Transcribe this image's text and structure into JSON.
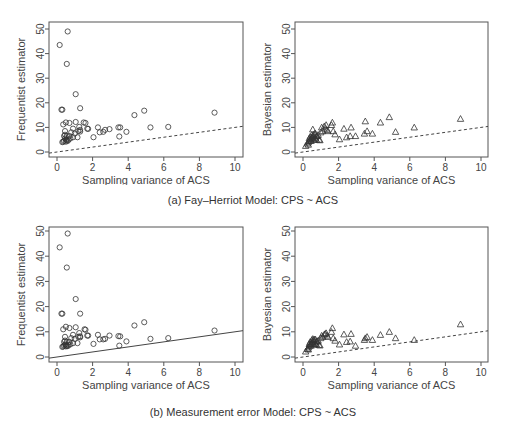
{
  "figure": {
    "caption_a": "(a) Fay–Herriot Model: CPS ~ ACS",
    "caption_b": "(b) Measurement error Model: CPS ~ ACS"
  },
  "chart_data": [
    {
      "id": "a-left",
      "type": "scatter",
      "title": "",
      "xlabel": "Sampling variance of ACS",
      "ylabel": "Frequentist estimator",
      "xlim": [
        0,
        10
      ],
      "ylim": [
        0,
        50
      ],
      "xticks": [
        0,
        2,
        4,
        6,
        8,
        10
      ],
      "yticks": [
        0,
        10,
        20,
        30,
        40,
        50
      ],
      "marker": "circle",
      "reference_line": {
        "style": "dashed",
        "slope": 1,
        "intercept": 0
      },
      "grid": false,
      "points": [
        [
          0.15,
          43.5
        ],
        [
          0.6,
          49
        ],
        [
          0.55,
          35.8
        ],
        [
          1.05,
          23.5
        ],
        [
          0.25,
          17.2
        ],
        [
          0.3,
          17.2
        ],
        [
          1.3,
          17.8
        ],
        [
          0.35,
          11.2
        ],
        [
          0.5,
          12
        ],
        [
          0.7,
          11.8
        ],
        [
          1.05,
          12.2
        ],
        [
          1.5,
          12
        ],
        [
          1.6,
          11.8
        ],
        [
          1.25,
          10.2
        ],
        [
          1.7,
          9.5
        ],
        [
          1.75,
          9.4
        ],
        [
          0.45,
          8.5
        ],
        [
          0.9,
          9.5
        ],
        [
          1.3,
          9.0
        ],
        [
          2.3,
          10
        ],
        [
          2.6,
          8.2
        ],
        [
          2.7,
          9
        ],
        [
          2.95,
          9.3
        ],
        [
          3.45,
          10
        ],
        [
          3.55,
          10
        ],
        [
          3.5,
          6.3
        ],
        [
          3.9,
          8.2
        ],
        [
          4.35,
          15
        ],
        [
          4.9,
          16.8
        ],
        [
          5.25,
          10
        ],
        [
          6.25,
          10.2
        ],
        [
          8.85,
          16
        ],
        [
          2.05,
          6
        ],
        [
          2.4,
          8
        ],
        [
          0.8,
          8
        ],
        [
          1.0,
          7.5
        ],
        [
          1.15,
          6
        ],
        [
          0.4,
          6.5
        ],
        [
          0.45,
          5.5
        ],
        [
          0.5,
          5
        ],
        [
          0.55,
          4.8
        ],
        [
          0.6,
          4.5
        ],
        [
          0.3,
          4
        ],
        [
          0.35,
          4.2
        ],
        [
          0.4,
          4.5
        ],
        [
          0.5,
          4.2
        ],
        [
          0.65,
          5
        ],
        [
          0.75,
          5.5
        ],
        [
          0.9,
          6
        ],
        [
          0.45,
          7
        ],
        [
          0.55,
          6.5
        ],
        [
          1.2,
          8.5
        ],
        [
          1.3,
          8.3
        ],
        [
          0.7,
          6.5
        ]
      ]
    },
    {
      "id": "a-right",
      "type": "scatter",
      "title": "",
      "xlabel": "Sampling variance of ACS",
      "ylabel": "Bayesian estimator",
      "xlim": [
        0,
        10
      ],
      "ylim": [
        0,
        50
      ],
      "xticks": [
        0,
        2,
        4,
        6,
        8,
        10
      ],
      "yticks": [
        0,
        10,
        20,
        30,
        40,
        50
      ],
      "marker": "triangle",
      "reference_line": {
        "style": "dashed",
        "slope": 1,
        "intercept": 0
      },
      "grid": false,
      "points": [
        [
          0.15,
          2.5
        ],
        [
          0.25,
          3.5
        ],
        [
          0.3,
          4
        ],
        [
          0.35,
          4.5
        ],
        [
          0.4,
          5
        ],
        [
          0.45,
          5.5
        ],
        [
          0.5,
          6
        ],
        [
          0.55,
          6.5
        ],
        [
          0.6,
          7
        ],
        [
          0.65,
          6
        ],
        [
          0.7,
          5.5
        ],
        [
          0.75,
          5
        ],
        [
          0.8,
          6.5
        ],
        [
          0.85,
          7
        ],
        [
          0.9,
          5
        ],
        [
          0.95,
          4.8
        ],
        [
          0.55,
          9.2
        ],
        [
          0.4,
          6.2
        ],
        [
          0.5,
          7
        ],
        [
          0.6,
          5
        ],
        [
          0.7,
          7.5
        ],
        [
          1.0,
          8
        ],
        [
          1.05,
          10
        ],
        [
          1.1,
          8.5
        ],
        [
          1.2,
          10.5
        ],
        [
          1.25,
          9.5
        ],
        [
          1.3,
          11
        ],
        [
          1.35,
          9
        ],
        [
          1.4,
          8.5
        ],
        [
          1.6,
          11
        ],
        [
          1.65,
          12
        ],
        [
          1.7,
          8.5
        ],
        [
          1.8,
          7.2
        ],
        [
          2.05,
          5.2
        ],
        [
          2.3,
          9.5
        ],
        [
          2.45,
          6
        ],
        [
          2.65,
          6.5
        ],
        [
          2.7,
          10
        ],
        [
          2.95,
          6.5
        ],
        [
          3.45,
          7.5
        ],
        [
          3.5,
          12.5
        ],
        [
          3.6,
          8.5
        ],
        [
          3.9,
          7.5
        ],
        [
          4.35,
          12
        ],
        [
          4.85,
          14.2
        ],
        [
          5.2,
          8.2
        ],
        [
          6.25,
          10
        ],
        [
          8.85,
          13.5
        ],
        [
          0.3,
          3
        ],
        [
          0.45,
          4.5
        ],
        [
          0.55,
          5.5
        ],
        [
          0.65,
          7.5
        ],
        [
          0.75,
          6.5
        ],
        [
          0.35,
          5.5
        ]
      ]
    },
    {
      "id": "b-left",
      "type": "scatter",
      "title": "",
      "xlabel": "Sampling variance of ACS",
      "ylabel": "Frequentist estimator",
      "xlim": [
        0,
        10
      ],
      "ylim": [
        0,
        50
      ],
      "xticks": [
        0,
        2,
        4,
        6,
        8,
        10
      ],
      "yticks": [
        0,
        10,
        20,
        30,
        40,
        50
      ],
      "marker": "circle",
      "reference_line": {
        "style": "solid",
        "slope": 1,
        "intercept": 0
      },
      "grid": false,
      "points": [
        [
          0.15,
          43.5
        ],
        [
          0.6,
          49
        ],
        [
          0.55,
          35.5
        ],
        [
          1.05,
          23
        ],
        [
          0.25,
          17.2
        ],
        [
          0.3,
          17.2
        ],
        [
          1.3,
          17.2
        ],
        [
          0.35,
          11
        ],
        [
          0.5,
          12
        ],
        [
          0.7,
          11.5
        ],
        [
          1.05,
          11.8
        ],
        [
          1.55,
          11
        ],
        [
          1.6,
          10.8
        ],
        [
          1.25,
          9.5
        ],
        [
          1.7,
          8.5
        ],
        [
          1.75,
          8.5
        ],
        [
          0.45,
          8
        ],
        [
          0.9,
          8.8
        ],
        [
          1.3,
          8.2
        ],
        [
          2.3,
          8.8
        ],
        [
          2.6,
          7
        ],
        [
          2.7,
          7.2
        ],
        [
          2.95,
          8.5
        ],
        [
          3.45,
          8.3
        ],
        [
          3.55,
          8.2
        ],
        [
          3.5,
          4.5
        ],
        [
          3.9,
          6.2
        ],
        [
          4.35,
          12.5
        ],
        [
          4.9,
          13.8
        ],
        [
          5.25,
          7.2
        ],
        [
          6.25,
          7.5
        ],
        [
          8.85,
          10.5
        ],
        [
          2.05,
          5.2
        ],
        [
          2.4,
          7
        ],
        [
          0.8,
          7.5
        ],
        [
          1.0,
          7.2
        ],
        [
          1.15,
          5.5
        ],
        [
          0.4,
          6
        ],
        [
          0.45,
          5
        ],
        [
          0.5,
          4.8
        ],
        [
          0.55,
          4.5
        ],
        [
          0.6,
          4.3
        ],
        [
          0.3,
          4
        ],
        [
          0.35,
          4.2
        ],
        [
          0.4,
          4.5
        ],
        [
          0.5,
          4.2
        ],
        [
          0.65,
          4.8
        ],
        [
          0.75,
          5
        ],
        [
          0.9,
          5.5
        ],
        [
          0.45,
          6.5
        ],
        [
          0.55,
          6
        ],
        [
          1.2,
          8
        ],
        [
          1.3,
          7.8
        ],
        [
          0.7,
          6
        ]
      ]
    },
    {
      "id": "b-right",
      "type": "scatter",
      "title": "",
      "xlabel": "Sampling variance of ACS",
      "ylabel": "Bayesian estimator",
      "xlim": [
        0,
        10
      ],
      "ylim": [
        0,
        50
      ],
      "xticks": [
        0,
        2,
        4,
        6,
        8,
        10
      ],
      "yticks": [
        0,
        10,
        20,
        30,
        40,
        50
      ],
      "marker": "triangle",
      "reference_line": {
        "style": "dashed",
        "slope": 1,
        "intercept": 0
      },
      "grid": false,
      "points": [
        [
          0.15,
          2.2
        ],
        [
          0.25,
          3.2
        ],
        [
          0.3,
          3.8
        ],
        [
          0.35,
          4.3
        ],
        [
          0.4,
          4.8
        ],
        [
          0.45,
          5.2
        ],
        [
          0.5,
          5.8
        ],
        [
          0.55,
          6.2
        ],
        [
          0.6,
          6.8
        ],
        [
          0.65,
          5.8
        ],
        [
          0.7,
          5.2
        ],
        [
          0.75,
          5
        ],
        [
          0.8,
          6.2
        ],
        [
          0.85,
          6.5
        ],
        [
          0.9,
          4.8
        ],
        [
          0.95,
          4.6
        ],
        [
          0.55,
          7.2
        ],
        [
          0.4,
          6
        ],
        [
          0.5,
          6.8
        ],
        [
          0.6,
          5
        ],
        [
          0.7,
          7
        ],
        [
          1.0,
          7.5
        ],
        [
          1.05,
          8.5
        ],
        [
          1.1,
          8
        ],
        [
          1.2,
          9
        ],
        [
          1.25,
          9.2
        ],
        [
          1.3,
          9.5
        ],
        [
          1.35,
          8.5
        ],
        [
          1.4,
          8
        ],
        [
          1.6,
          10
        ],
        [
          1.65,
          11.5
        ],
        [
          1.7,
          7.5
        ],
        [
          1.8,
          6.5
        ],
        [
          2.05,
          5
        ],
        [
          2.3,
          9
        ],
        [
          2.45,
          6
        ],
        [
          2.65,
          6.2
        ],
        [
          2.7,
          9.2
        ],
        [
          2.95,
          4.5
        ],
        [
          3.45,
          6.8
        ],
        [
          3.5,
          7.5
        ],
        [
          3.6,
          8
        ],
        [
          3.9,
          6.8
        ],
        [
          4.35,
          8.8
        ],
        [
          4.85,
          10
        ],
        [
          5.2,
          7.5
        ],
        [
          6.25,
          6.8
        ],
        [
          8.85,
          13
        ],
        [
          0.3,
          3
        ],
        [
          0.45,
          4.5
        ],
        [
          0.55,
          5.5
        ],
        [
          0.65,
          7
        ],
        [
          0.75,
          6.2
        ],
        [
          0.35,
          5.2
        ]
      ]
    }
  ]
}
